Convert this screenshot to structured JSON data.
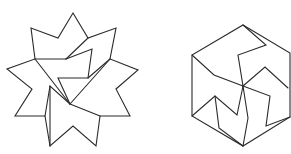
{
  "figures": [
    {
      "name": "dissected-star",
      "shape": "9-point star dissected into pieces",
      "stroke_color": "#2a2a2a",
      "outline": [
        [
          73,
          13
        ],
        [
          88,
          38
        ],
        [
          116,
          28
        ],
        [
          110,
          59
        ],
        [
          138,
          70
        ],
        [
          116,
          89
        ],
        [
          130,
          116
        ],
        [
          100,
          116
        ],
        [
          96,
          146
        ],
        [
          73,
          126
        ],
        [
          50,
          146
        ],
        [
          45,
          116
        ],
        [
          15,
          116
        ],
        [
          32,
          89
        ],
        [
          7,
          69
        ],
        [
          35,
          59
        ],
        [
          31,
          28
        ],
        [
          58,
          38
        ]
      ],
      "inner_lines": [
        [
          [
            35,
            59
          ],
          [
            70,
            104
          ]
        ],
        [
          [
            35,
            59
          ],
          [
            66,
            59
          ]
        ],
        [
          [
            66,
            59
          ],
          [
            92,
            49
          ],
          [
            88,
            78
          ],
          [
            58,
            78
          ],
          [
            70,
            104
          ]
        ],
        [
          [
            88,
            38
          ],
          [
            66,
            59
          ]
        ],
        [
          [
            110,
            59
          ],
          [
            70,
            104
          ]
        ],
        [
          [
            110,
            59
          ],
          [
            88,
            78
          ]
        ],
        [
          [
            70,
            104
          ],
          [
            100,
            116
          ]
        ],
        [
          [
            70,
            104
          ],
          [
            50,
            86
          ],
          [
            45,
            116
          ]
        ],
        [
          [
            50,
            86
          ],
          [
            50,
            146
          ]
        ]
      ]
    },
    {
      "name": "dissected-hexagon",
      "shape": "hexagon dissected into pieces",
      "stroke_color": "#2a2a2a",
      "outline": [
        [
          243,
          25
        ],
        [
          290,
          53
        ],
        [
          290,
          117
        ],
        [
          243,
          146
        ],
        [
          192,
          116
        ],
        [
          192,
          55
        ]
      ],
      "inner_lines": [
        [
          [
            243,
            25
          ],
          [
            266,
            45
          ],
          [
            238,
            55
          ],
          [
            243,
            86
          ]
        ],
        [
          [
            192,
            55
          ],
          [
            214,
            75
          ],
          [
            243,
            86
          ]
        ],
        [
          [
            243,
            86
          ],
          [
            265,
            67
          ],
          [
            288,
            88
          ]
        ],
        [
          [
            243,
            86
          ],
          [
            270,
            96
          ],
          [
            266,
            126
          ],
          [
            290,
            117
          ]
        ],
        [
          [
            243,
            86
          ],
          [
            248,
            118
          ],
          [
            243,
            146
          ]
        ],
        [
          [
            243,
            86
          ],
          [
            237,
            115
          ],
          [
            215,
            96
          ],
          [
            192,
            116
          ]
        ],
        [
          [
            215,
            96
          ],
          [
            219,
            128
          ],
          [
            243,
            146
          ]
        ]
      ]
    }
  ]
}
